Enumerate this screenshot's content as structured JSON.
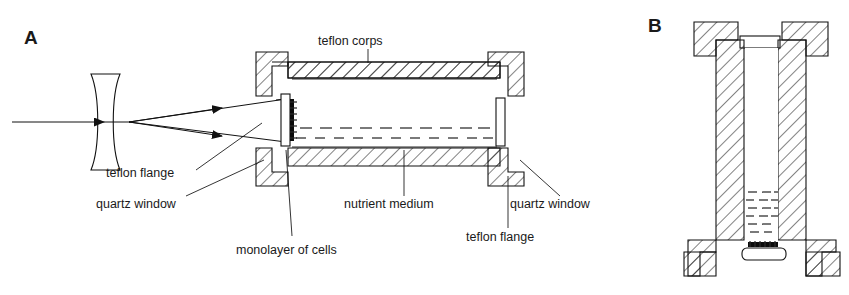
{
  "figure": {
    "type": "scientific-cross-section-diagram",
    "background_color": "#ffffff",
    "ink_color": "#111111",
    "panels": [
      {
        "id": "A",
        "letter": "A",
        "orientation": "horizontal",
        "description": "Longitudinal section of the chamber with incident beam, diverging lens and beam path entering the quartz window"
      },
      {
        "id": "B",
        "letter": "B",
        "orientation": "vertical",
        "description": "Transverse/upright section of the same chamber showing nutrient medium settled at the bottom over the cell monolayer"
      }
    ],
    "callouts": [
      {
        "key": "teflon_corps",
        "text": "teflon  corps",
        "panel": "A",
        "position": "top"
      },
      {
        "key": "teflon_flange_l",
        "text": "teflon  flange",
        "panel": "A",
        "position": "lower-left"
      },
      {
        "key": "quartz_window_l",
        "text": "quartz  window",
        "panel": "A",
        "position": "lower-left"
      },
      {
        "key": "monolayer",
        "text": "monolayer  of  cells",
        "panel": "A",
        "position": "bottom-center"
      },
      {
        "key": "nutrient_medium",
        "text": "nutrient  medium",
        "panel": "A",
        "position": "bottom-center"
      },
      {
        "key": "quartz_window_r",
        "text": "quartz  window",
        "panel": "A",
        "position": "lower-right"
      },
      {
        "key": "teflon_flange_r",
        "text": "teflon  flange",
        "panel": "A",
        "position": "bottom-right"
      }
    ],
    "components": {
      "lens": {
        "name": "diverging (biconcave) lens",
        "shown": true
      },
      "beam": {
        "name": "incident light beam",
        "arrowheads": 3,
        "rays": 2
      },
      "quartz_windows": 2,
      "teflon_flanges": 4,
      "cell_monolayer": {
        "rendered_as": "dense black strip on inner window face"
      },
      "nutrient_medium": {
        "rendered_as": "rows of short horizontal dashes"
      }
    }
  }
}
